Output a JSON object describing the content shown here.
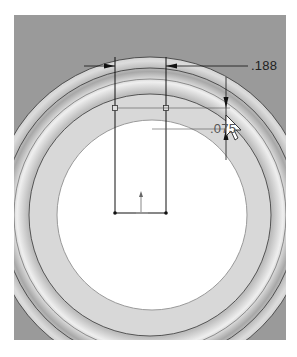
{
  "viewport": {
    "background_color": "#9a9a9a",
    "part_face_color": "#d6d6d6",
    "hole_color": "#ffffff"
  },
  "dimensions": {
    "width_dim": ".188",
    "depth_dim": ".075"
  },
  "sketch": {
    "line_color": "#111111",
    "origin_icon": "origin-arrow-icon"
  },
  "cursor": {
    "icon": "arrow-cursor-icon"
  }
}
